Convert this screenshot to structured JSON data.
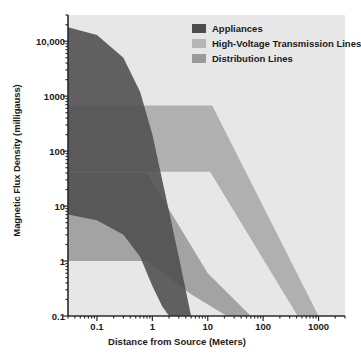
{
  "chart_data": {
    "type": "area",
    "title": "",
    "xlabel": "Distance from Source (Meters)",
    "ylabel": "Magnetic Flux Density (milligauss)",
    "xscale": "log",
    "yscale": "log",
    "xlim": [
      0.03,
      3000
    ],
    "ylim": [
      0.1,
      30000
    ],
    "xticks": [
      "0.1",
      "1",
      "10",
      "100",
      "1000"
    ],
    "xtick_values": [
      0.1,
      1,
      10,
      100,
      1000
    ],
    "yticks": [
      "10,000",
      "1000",
      "100",
      "10",
      "1",
      "0.1"
    ],
    "ytick_values": [
      10000,
      1000,
      100,
      10,
      1,
      0.1
    ],
    "grid": false,
    "legend_position": "top-right",
    "plot_background": "#e7e7e7",
    "series": [
      {
        "name": "Appliances",
        "color": "#4d4d4d",
        "upper_bound": {
          "x": [
            0.03,
            0.1,
            0.3,
            0.6,
            1.0,
            2.0,
            3.0,
            5.0
          ],
          "y": [
            18000,
            13000,
            5000,
            1200,
            200,
            8,
            1.2,
            0.1
          ]
        },
        "lower_bound": {
          "x": [
            0.03,
            0.1,
            0.3,
            0.6,
            1.0,
            1.5,
            2.0
          ],
          "y": [
            7,
            5.5,
            3.0,
            1.2,
            0.35,
            0.15,
            0.1
          ]
        }
      },
      {
        "name": "High-Voltage Transmission Lines",
        "color": "#a8a8a8",
        "upper_bound": {
          "x": [
            0.03,
            12.0,
            1000.0,
            2300.0
          ],
          "y": [
            680,
            680,
            0.1,
            0.1
          ]
        },
        "lower_bound": {
          "x": [
            0.03,
            11.0,
            420.0
          ],
          "y": [
            42,
            42,
            0.1
          ]
        }
      },
      {
        "name": "Distribution Lines",
        "color": "#9a9a9a",
        "upper_bound": {
          "x": [
            0.03,
            0.8,
            10.0,
            60.0
          ],
          "y": [
            40,
            40,
            0.6,
            0.1
          ]
        },
        "lower_bound": {
          "x": [
            0.03,
            0.8,
            5.0,
            22.0
          ],
          "y": [
            1.0,
            1.0,
            0.25,
            0.1
          ]
        }
      }
    ]
  },
  "legend": {
    "items": [
      {
        "label": "Appliances",
        "color": "#4d4d4d"
      },
      {
        "label": "High-Voltage Transmission Lines",
        "color": "#b6b6b6"
      },
      {
        "label": "Distribution Lines",
        "color": "#9a9a9a"
      }
    ]
  },
  "axes": {
    "x_title": "Distance from Source (Meters)",
    "y_title": "Magnetic Flux Density (milligauss)",
    "x_tick_labels": [
      "0.1",
      "1",
      "10",
      "100",
      "1000"
    ],
    "y_tick_labels": [
      "10,000",
      "1000",
      "100",
      "10",
      "1",
      "0.1"
    ]
  },
  "colors": {
    "plot_background": "#e7e7e7",
    "axis": "#2b2b2b",
    "text": "#1a1a1a",
    "appliances": "#4d4d4d",
    "high_voltage": "#b6b6b6",
    "distribution": "#9a9a9a"
  }
}
